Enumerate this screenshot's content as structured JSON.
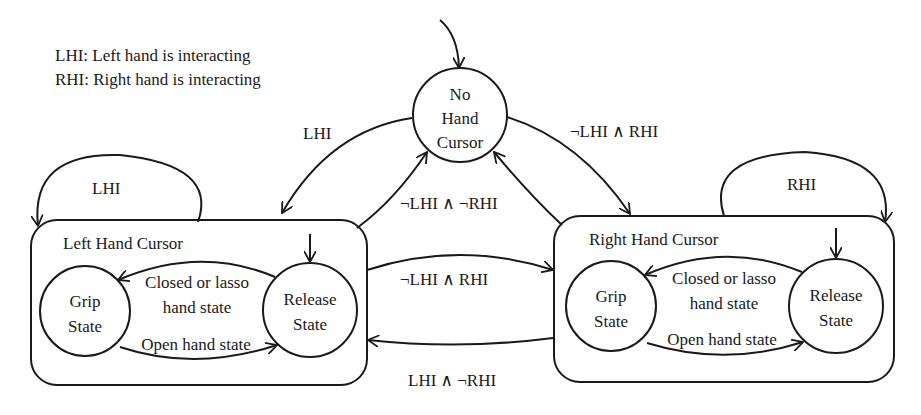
{
  "legend": {
    "lhi": "LHI: Left hand is interacting",
    "rhi": "RHI: Right hand is interacting"
  },
  "states": {
    "no_hand": {
      "line1": "No",
      "line2": "Hand",
      "line3": "Cursor"
    },
    "left_box": {
      "title": "Left Hand Cursor",
      "grip": {
        "line1": "Grip",
        "line2": "State"
      },
      "release": {
        "line1": "Release",
        "line2": "State"
      },
      "to_grip": {
        "line1": "Closed or lasso",
        "line2": "hand state"
      },
      "to_release": "Open hand state"
    },
    "right_box": {
      "title": "Right Hand Cursor",
      "grip": {
        "line1": "Grip",
        "line2": "State"
      },
      "release": {
        "line1": "Release",
        "line2": "State"
      },
      "to_grip": {
        "line1": "Closed or lasso",
        "line2": "hand state"
      },
      "to_release": "Open hand state"
    }
  },
  "transitions": {
    "none_to_left": "LHI",
    "none_to_right": "¬LHI ∧ RHI",
    "to_none": "¬LHI ∧ ¬RHI",
    "left_self": "LHI",
    "right_self": "RHI",
    "left_to_right": "¬LHI ∧ RHI",
    "right_to_left": "LHI ∧ ¬RHI"
  },
  "colors": {
    "ink": "#1a1a1a",
    "background": "#ffffff"
  }
}
